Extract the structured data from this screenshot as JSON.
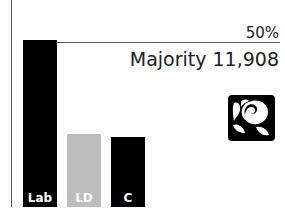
{
  "chart_data": {
    "type": "bar",
    "title": "",
    "categories": [
      "Lab",
      "LD",
      "C"
    ],
    "values": [
      50.6,
      22.1,
      21.2
    ],
    "colors": [
      "#000000",
      "#bdbdbd",
      "#000000"
    ],
    "reference_line": {
      "value": 50,
      "label": "50%"
    },
    "annotation": "Majority 11,908",
    "xlabel": "",
    "ylabel": "",
    "ylim": [
      0,
      50
    ],
    "grid": false,
    "legend": "none",
    "winner_icon": "labour-rose-icon"
  },
  "labels": {
    "ref": "50%",
    "majority": "Majority 11,908",
    "bars": [
      "Lab",
      "LD",
      "C"
    ]
  }
}
